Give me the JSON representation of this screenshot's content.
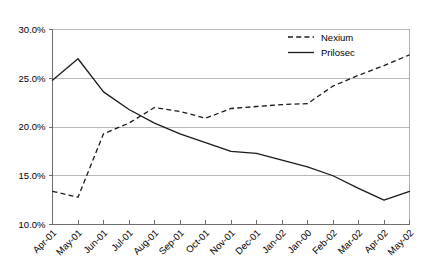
{
  "chart_data": {
    "type": "line",
    "title": "",
    "xlabel": "",
    "ylabel": "",
    "ylim": [
      10.0,
      30.0
    ],
    "ytick_values": [
      10.0,
      15.0,
      20.0,
      25.0,
      30.0
    ],
    "ytick_labels": [
      "10.0%",
      "15.0%",
      "20.0%",
      "25.0%",
      "30.0%"
    ],
    "grid": "horizontal",
    "legend_position": "top-right",
    "categories": [
      "Apr-01",
      "May-01",
      "Jun-01",
      "Jul-01",
      "Aug-01",
      "Sep-01",
      "Oct-01",
      "Nov-01",
      "Dec-01",
      "Jan-02",
      "Jan-00",
      "Feb-02",
      "Mar-02",
      "Apr-02",
      "May-02"
    ],
    "series": [
      {
        "name": "Nexium",
        "style": "dashed",
        "color": "#1a1a1a",
        "values": [
          13.4,
          12.8,
          19.3,
          20.4,
          22.0,
          21.6,
          20.9,
          21.9,
          22.1,
          22.3,
          22.4,
          24.2,
          25.3,
          26.3,
          27.4
        ]
      },
      {
        "name": "Prilosec",
        "style": "solid",
        "color": "#1a1a1a",
        "values": [
          24.8,
          27.0,
          23.6,
          21.8,
          20.4,
          19.3,
          18.4,
          17.5,
          17.3,
          16.6,
          15.9,
          15.0,
          13.7,
          12.5,
          13.4
        ]
      }
    ],
    "legend": [
      {
        "label": "Nexium",
        "style": "dashed"
      },
      {
        "label": "Prilosec",
        "style": "solid"
      }
    ]
  }
}
